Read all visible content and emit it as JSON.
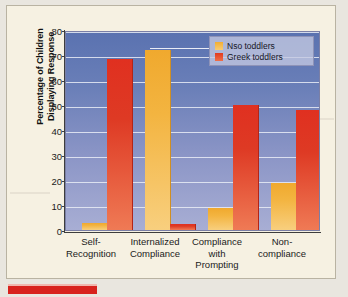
{
  "chart_data": {
    "type": "bar",
    "title": "",
    "xlabel": "",
    "ylabel": "Percentage of Children Displaying Response",
    "ylabel_line1": "Percentage of Children",
    "ylabel_line2": "Displaying Response",
    "ylim": [
      0,
      80
    ],
    "ytick_step": 10,
    "yticks": [
      80,
      70,
      60,
      50,
      40,
      30,
      20,
      10,
      0
    ],
    "grid": true,
    "legend_position": "top-right",
    "categories": [
      "Self-\nRecognition",
      "Internalized\nCompliance",
      "Compliance\nwith\nPrompting",
      "Non-\ncompliance"
    ],
    "category_lines": [
      [
        "Self-",
        "Recognition"
      ],
      [
        "Internalized",
        "Compliance"
      ],
      [
        "Compliance",
        "with",
        "Prompting"
      ],
      [
        "Non-",
        "compliance"
      ]
    ],
    "series": [
      {
        "name": "Nso toddlers",
        "color": "#f2ae33",
        "values": [
          3,
          72,
          9,
          19
        ]
      },
      {
        "name": "Greek toddlers",
        "color": "#e23a1f",
        "values": [
          68.5,
          2.5,
          50,
          48
        ]
      }
    ]
  },
  "legend": {
    "items": [
      {
        "label": "Nso toddlers",
        "swatch": "legend-swatch-nso"
      },
      {
        "label": "Greek toddlers",
        "swatch": "legend-swatch-greek"
      }
    ]
  },
  "colors": {
    "page_background": "#f6f1e2",
    "outer_background": "#e9e6df",
    "plot_gradient_top": "#5a72b0",
    "plot_gradient_bottom": "#a8aed4",
    "gridline": "#e9ecf6",
    "axis": "#3d3d3d",
    "series_nso": "#f2ae33",
    "series_greek": "#e23a1f",
    "accent_rule": "#d8221d"
  }
}
